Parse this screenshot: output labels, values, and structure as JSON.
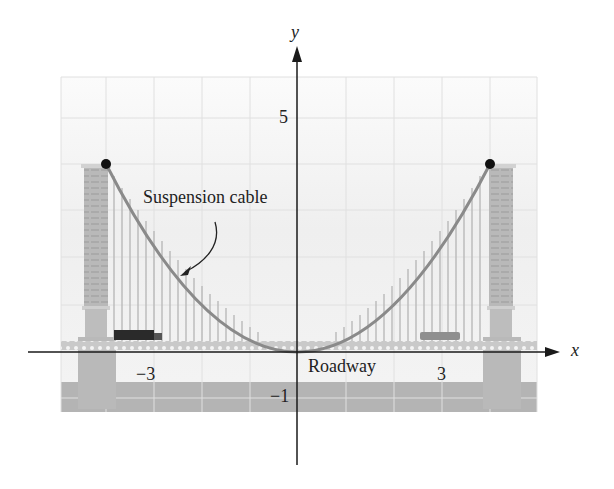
{
  "figure": {
    "type": "suspension-bridge-parabola",
    "axes": {
      "x_label": "x",
      "y_label": "y",
      "tick_labels": {
        "x_neg3": "−3",
        "x_pos3": "3",
        "y_pos5": "5",
        "y_neg1": "−1"
      },
      "x_range": [
        -5,
        5
      ],
      "y_range": [
        -2,
        6
      ],
      "grid": true
    },
    "annotations": {
      "cable_label": "Suspension cable",
      "roadway_label": "Roadway"
    },
    "cable": {
      "equation": "y = x^2 / 4",
      "left_tower_top": [
        -4,
        4
      ],
      "right_tower_top": [
        4,
        4
      ],
      "vertex": [
        0,
        0
      ]
    },
    "colors": {
      "cable": "#8a8a8a",
      "grid": "#e3e3e3",
      "tower": "#b8b8b8",
      "water": "#b2b2b2",
      "axis": "#1a1a1a",
      "point": "#111111"
    }
  }
}
